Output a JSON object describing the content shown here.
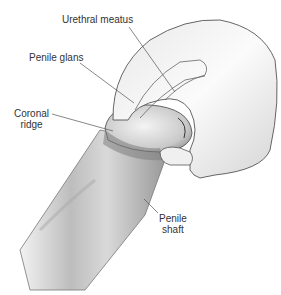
{
  "diagram": {
    "type": "anatomical-illustration",
    "labels": [
      {
        "id": "urethral-meatus",
        "text": "Urethral meatus"
      },
      {
        "id": "penile-glans",
        "text": "Penile glans"
      },
      {
        "id": "coronal-ridge",
        "lines": [
          "Coronal",
          "ridge"
        ]
      },
      {
        "id": "penile-shaft",
        "lines": [
          "Penile",
          "shaft"
        ]
      }
    ]
  }
}
